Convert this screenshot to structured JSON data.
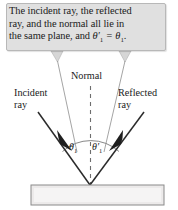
{
  "figure": {
    "callout": {
      "text_line1": "The incident ray, the reflected",
      "text_line2": "ray, and the normal all lie in",
      "text_line3_prefix": "the same plane, and ",
      "equation": "θ′1 = θ1",
      "equation_theta_prime": "θ′",
      "equation_sub_1": "1",
      "equation_equals": " = ",
      "equation_theta": "θ",
      "equation_sub_2": "1",
      "equation_period": ".",
      "background_color": "#e0e0e0",
      "border_color": "#b8b8b8"
    },
    "labels": {
      "normal": "Normal",
      "incident_line1": "Incident",
      "incident_line2": "ray",
      "reflected_line1": "Reflected",
      "reflected_line2": "ray"
    },
    "angles": {
      "incident_symbol": "θ",
      "incident_subscript": "1",
      "reflected_symbol": "θ′",
      "reflected_subscript": "1"
    },
    "surface": {
      "name": "reflecting-surface-slab",
      "fill_color": "#eceaea",
      "border_color": "#8a8a8a"
    },
    "colors": {
      "ray_color": "#2b2b2b",
      "leader_color": "#9a9a9a",
      "normal_dash_color": "#6e6e6e",
      "arc_color": "#6e6e6e",
      "text_color": "#1a1a1a",
      "background": "#ffffff"
    }
  }
}
